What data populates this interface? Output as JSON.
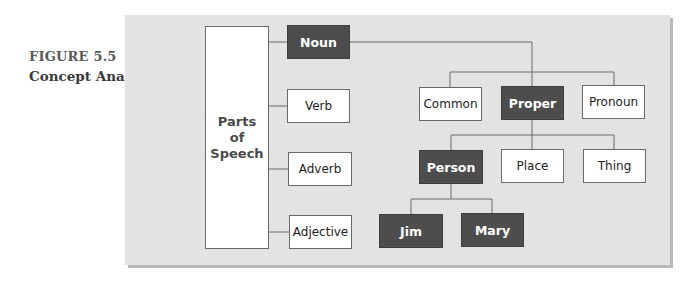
{
  "caption": {
    "figure_label": "FIGURE 5.5",
    "title": "Concept Analysis"
  },
  "diagram": {
    "root": {
      "lines": [
        "Parts",
        "of",
        "Speech"
      ]
    },
    "nodes": {
      "noun": "Noun",
      "verb": "Verb",
      "adverb": "Adverb",
      "adjective": "Adjective",
      "common": "Common",
      "proper": "Proper",
      "pronoun": "Pronoun",
      "person": "Person",
      "place": "Place",
      "thing": "Thing",
      "jim": "Jim",
      "mary": "Mary"
    },
    "highlighted": [
      "Noun",
      "Proper",
      "Person",
      "Jim",
      "Mary"
    ],
    "colors": {
      "panel_bg": "#e3e3e3",
      "highlight_fill": "#4d4d4d",
      "normal_fill": "#ffffff",
      "line": "#6a6a6a"
    }
  }
}
